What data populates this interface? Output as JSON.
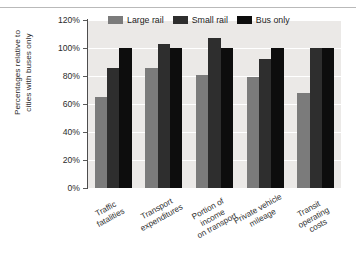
{
  "chart_data": {
    "type": "bar",
    "title": "",
    "subtitle": "",
    "xlabel": "",
    "ylabel": "Percentages relative to\ncities with buses only",
    "ylim": [
      0,
      120
    ],
    "ytick_labels": [
      "0%",
      "20%",
      "40%",
      "60%",
      "80%",
      "100%",
      "120%"
    ],
    "ytick_values": [
      0,
      20,
      40,
      60,
      80,
      100,
      120
    ],
    "grid": true,
    "legend_position": "top-center",
    "categories": [
      "Traffic\nfatalities",
      "Transport\nexpenditures",
      "Portion of income\non transport",
      "Private vehicle\nmileage",
      "Transit\noperating\ncosts"
    ],
    "series": [
      {
        "name": "Large rail",
        "color": "#7b7b7b",
        "values": [
          65,
          86,
          81,
          79,
          68
        ]
      },
      {
        "name": "Small rail",
        "color": "#2e2e2e",
        "values": [
          86,
          103,
          107,
          92,
          100
        ]
      },
      {
        "name": "Bus only",
        "color": "#0d0d0d",
        "values": [
          100,
          100,
          100,
          100,
          100
        ]
      }
    ]
  },
  "legend": {
    "items": [
      {
        "label": "Large rail"
      },
      {
        "label": "Small rail"
      },
      {
        "label": "Bus only"
      }
    ]
  },
  "colors": {
    "series_large_rail": "#7b7b7b",
    "series_small_rail": "#2e2e2e",
    "series_bus_only": "#0d0d0d",
    "plot_background": "#ebe9e7",
    "gridline": "#ffffff",
    "axis": "#4d4d4d",
    "text": "#2b2b2b",
    "page_background": "#ffffff"
  }
}
